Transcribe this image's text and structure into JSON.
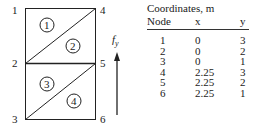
{
  "diagram": {
    "nodes": [
      {
        "id": "1",
        "label": "1"
      },
      {
        "id": "2",
        "label": "2"
      },
      {
        "id": "3",
        "label": "3"
      },
      {
        "id": "4",
        "label": "4"
      },
      {
        "id": "5",
        "label": "5"
      },
      {
        "id": "6",
        "label": "6"
      }
    ],
    "elements": [
      {
        "id": "1",
        "label": "1"
      },
      {
        "id": "2",
        "label": "2"
      },
      {
        "id": "3",
        "label": "3"
      },
      {
        "id": "4",
        "label": "4"
      }
    ],
    "force": {
      "label": "f",
      "subscript": "y"
    }
  },
  "table": {
    "title": "Coordinates, m",
    "headers": {
      "node": "Node",
      "x": "x",
      "y": "y"
    },
    "rows": [
      {
        "node": "1",
        "x": "0",
        "y": "3"
      },
      {
        "node": "2",
        "x": "0",
        "y": "2"
      },
      {
        "node": "3",
        "x": "0",
        "y": "1"
      },
      {
        "node": "4",
        "x": "2.25",
        "y": "3"
      },
      {
        "node": "5",
        "x": "2.25",
        "y": "2"
      },
      {
        "node": "6",
        "x": "2.25",
        "y": "1"
      }
    ]
  }
}
